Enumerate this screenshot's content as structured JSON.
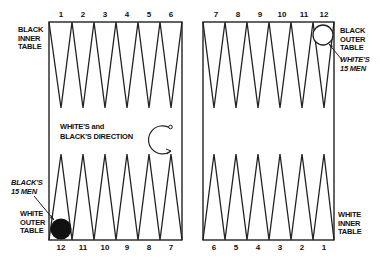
{
  "board": {
    "top_point_numbers_left": [
      "1",
      "2",
      "3",
      "4",
      "5",
      "6"
    ],
    "top_point_numbers_right": [
      "7",
      "8",
      "9",
      "10",
      "11",
      "12"
    ],
    "bottom_point_numbers_left": [
      "12",
      "11",
      "10",
      "9",
      "8",
      "7"
    ],
    "bottom_point_numbers_right": [
      "6",
      "5",
      "4",
      "3",
      "2",
      "1"
    ]
  },
  "labels": {
    "black_inner_table": "BLACK\nINNER\nTABLE",
    "black_outer_table": "BLACK\nOUTER\nTABLE",
    "white_outer_table": "WHITE\nOUTER\nTABLE",
    "white_inner_table": "WHITE\nINNER\nTABLE",
    "whites_15_men": "WHITE'S\n15 MEN",
    "blacks_15_men": "BLACK'S\n15 MEN",
    "direction_line1": "WHITE'S and",
    "direction_line2": "BLACK'S DIRECTION"
  },
  "colors": {
    "line": "#222222",
    "black_checker": "#111111",
    "white_checker": "#ffffff"
  }
}
